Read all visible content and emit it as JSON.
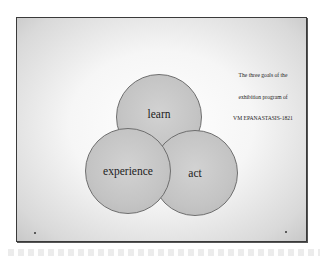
{
  "slide": {
    "caption_lines": [
      "The three goals of the",
      "exhibition program of",
      "VM EPANASTASIS-1821"
    ],
    "circles": [
      {
        "id": "learn",
        "label": "learn"
      },
      {
        "id": "experience",
        "label": "experience"
      },
      {
        "id": "act",
        "label": "act"
      }
    ]
  },
  "colors": {
    "circle_fill": "#c4c4c4",
    "circle_border": "#6e6e6e",
    "frame_border": "#3a3a3a",
    "text": "#1c1c1c"
  }
}
